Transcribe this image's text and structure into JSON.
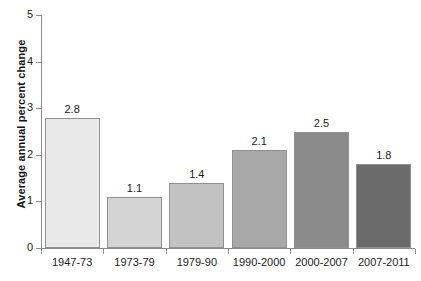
{
  "chart_data": {
    "type": "bar",
    "title": "",
    "subtitle": "",
    "xlabel": "",
    "ylabel": "Average annual percent change",
    "categories": [
      "1947-73",
      "1973-79",
      "1979-90",
      "1990-2000",
      "2000-2007",
      "2007-2011"
    ],
    "values": [
      2.8,
      1.1,
      1.4,
      2.1,
      2.5,
      1.8
    ],
    "value_labels": [
      "2.8",
      "1.1",
      "1.4",
      "2.1",
      "2.5",
      "1.8"
    ],
    "ylim": [
      0,
      5
    ],
    "ytick_labels": [
      "0",
      "1",
      "2",
      "3",
      "4",
      "5"
    ],
    "ytick_values": [
      0,
      1,
      2,
      3,
      4,
      5
    ],
    "grid": false,
    "legend": false,
    "legend_position": "none",
    "bar_colors": [
      "#e9e9e9",
      "#d4d4d4",
      "#c2c2c2",
      "#a8a8a8",
      "#8b8b8b",
      "#6b6b6b"
    ],
    "bar_border_color": "#909090",
    "axis_color": "#8d8d8d",
    "background_color": "#ffffff",
    "text_color": "#1a1a1a"
  }
}
